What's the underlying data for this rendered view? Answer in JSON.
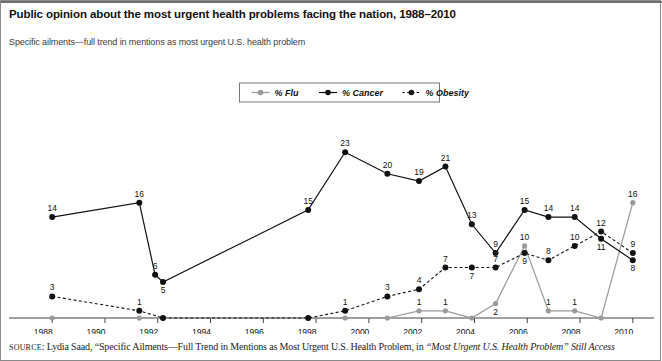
{
  "title": "Public opinion about the most urgent health problems facing the nation, 1988–2010",
  "subtitle": "Specific ailments—full trend in mentions as most urgent U.S. health problem",
  "source": {
    "label": "SOURCE",
    "text_a": ": Lydia Saad, “Specific Ailments—Full Trend in Mentions as Most Urgent U.S. Health Problem, in ",
    "text_b": "“Most Urgent U.S. Health Problem” Still Access"
  },
  "colors": {
    "flu": "#9a9a9a",
    "cancer": "#111111",
    "obesity": "#111111",
    "axis": "#444444",
    "frame": "#8a8a8a"
  },
  "legend": {
    "items": [
      {
        "label": "% Flu",
        "color": "#9a9a9a",
        "style": "solid"
      },
      {
        "label": "% Cancer",
        "color": "#111111",
        "style": "solid"
      },
      {
        "label": "% Obesity",
        "color": "#111111",
        "style": "dashed"
      }
    ]
  },
  "chart_data": {
    "type": "line",
    "title": "Public opinion about the most urgent health problems facing the nation, 1988–2010",
    "subtitle": "Specific ailments—full trend in mentions as most urgent U.S. health problem",
    "xlabel": "",
    "ylabel": "",
    "xlim": [
      1987.5,
      2010.5
    ],
    "ylim": [
      0,
      24
    ],
    "grid": false,
    "legend_position": "top-center",
    "xticks": [
      1988,
      1990,
      1992,
      1994,
      1996,
      1998,
      2000,
      2002,
      2004,
      2006,
      2008,
      2010
    ],
    "series": [
      {
        "name": "% Flu",
        "color": "#9a9a9a",
        "style": "solid",
        "points": [
          {
            "x": 1988.0,
            "y": 0,
            "label": ""
          },
          {
            "x": 1991.3,
            "y": 0,
            "label": ""
          },
          {
            "x": 1992.2,
            "y": 0,
            "label": ""
          },
          {
            "x": 1997.7,
            "y": 0,
            "label": ""
          },
          {
            "x": 1999.1,
            "y": 0,
            "label": ""
          },
          {
            "x": 2000.7,
            "y": 0,
            "label": ""
          },
          {
            "x": 2001.9,
            "y": 1,
            "label": "1"
          },
          {
            "x": 2002.9,
            "y": 1,
            "label": "1"
          },
          {
            "x": 2003.9,
            "y": 0,
            "label": ""
          },
          {
            "x": 2004.8,
            "y": 2,
            "label": "2"
          },
          {
            "x": 2005.9,
            "y": 10,
            "label": "10"
          },
          {
            "x": 2006.8,
            "y": 1,
            "label": "1"
          },
          {
            "x": 2007.8,
            "y": 1,
            "label": "1"
          },
          {
            "x": 2008.8,
            "y": 0,
            "label": ""
          },
          {
            "x": 2010.0,
            "y": 16,
            "label": "16"
          }
        ]
      },
      {
        "name": "% Cancer",
        "color": "#111111",
        "style": "solid",
        "points": [
          {
            "x": 1988.0,
            "y": 14,
            "label": "14"
          },
          {
            "x": 1991.3,
            "y": 16,
            "label": "16"
          },
          {
            "x": 1991.9,
            "y": 6,
            "label": "6"
          },
          {
            "x": 1992.2,
            "y": 5,
            "label": "5"
          },
          {
            "x": 1997.7,
            "y": 15,
            "label": "15"
          },
          {
            "x": 1999.1,
            "y": 23,
            "label": "23"
          },
          {
            "x": 2000.7,
            "y": 20,
            "label": "20"
          },
          {
            "x": 2001.9,
            "y": 19,
            "label": "19"
          },
          {
            "x": 2002.9,
            "y": 21,
            "label": "21"
          },
          {
            "x": 2003.9,
            "y": 13,
            "label": "13"
          },
          {
            "x": 2004.8,
            "y": 9,
            "label": "9"
          },
          {
            "x": 2005.9,
            "y": 15,
            "label": "15"
          },
          {
            "x": 2006.8,
            "y": 14,
            "label": "14"
          },
          {
            "x": 2007.8,
            "y": 14,
            "label": "14"
          },
          {
            "x": 2008.8,
            "y": 11,
            "label": "11"
          },
          {
            "x": 2010.0,
            "y": 8,
            "label": "8"
          }
        ]
      },
      {
        "name": "% Obesity",
        "color": "#111111",
        "style": "dashed",
        "points": [
          {
            "x": 1988.0,
            "y": 3,
            "label": "3"
          },
          {
            "x": 1991.3,
            "y": 1,
            "label": "1"
          },
          {
            "x": 1992.2,
            "y": 0,
            "label": ""
          },
          {
            "x": 1997.7,
            "y": 0,
            "label": ""
          },
          {
            "x": 1999.1,
            "y": 1,
            "label": "1"
          },
          {
            "x": 2000.7,
            "y": 3,
            "label": "3"
          },
          {
            "x": 2001.9,
            "y": 4,
            "label": "4"
          },
          {
            "x": 2002.9,
            "y": 7,
            "label": "7"
          },
          {
            "x": 2003.9,
            "y": 7,
            "label": "7"
          },
          {
            "x": 2004.8,
            "y": 7,
            "label": "7"
          },
          {
            "x": 2005.9,
            "y": 9,
            "label": "9"
          },
          {
            "x": 2006.8,
            "y": 8,
            "label": "8"
          },
          {
            "x": 2007.8,
            "y": 10,
            "label": "10"
          },
          {
            "x": 2008.8,
            "y": 12,
            "label": "12"
          },
          {
            "x": 2010.0,
            "y": 9,
            "label": "9"
          }
        ]
      }
    ]
  }
}
